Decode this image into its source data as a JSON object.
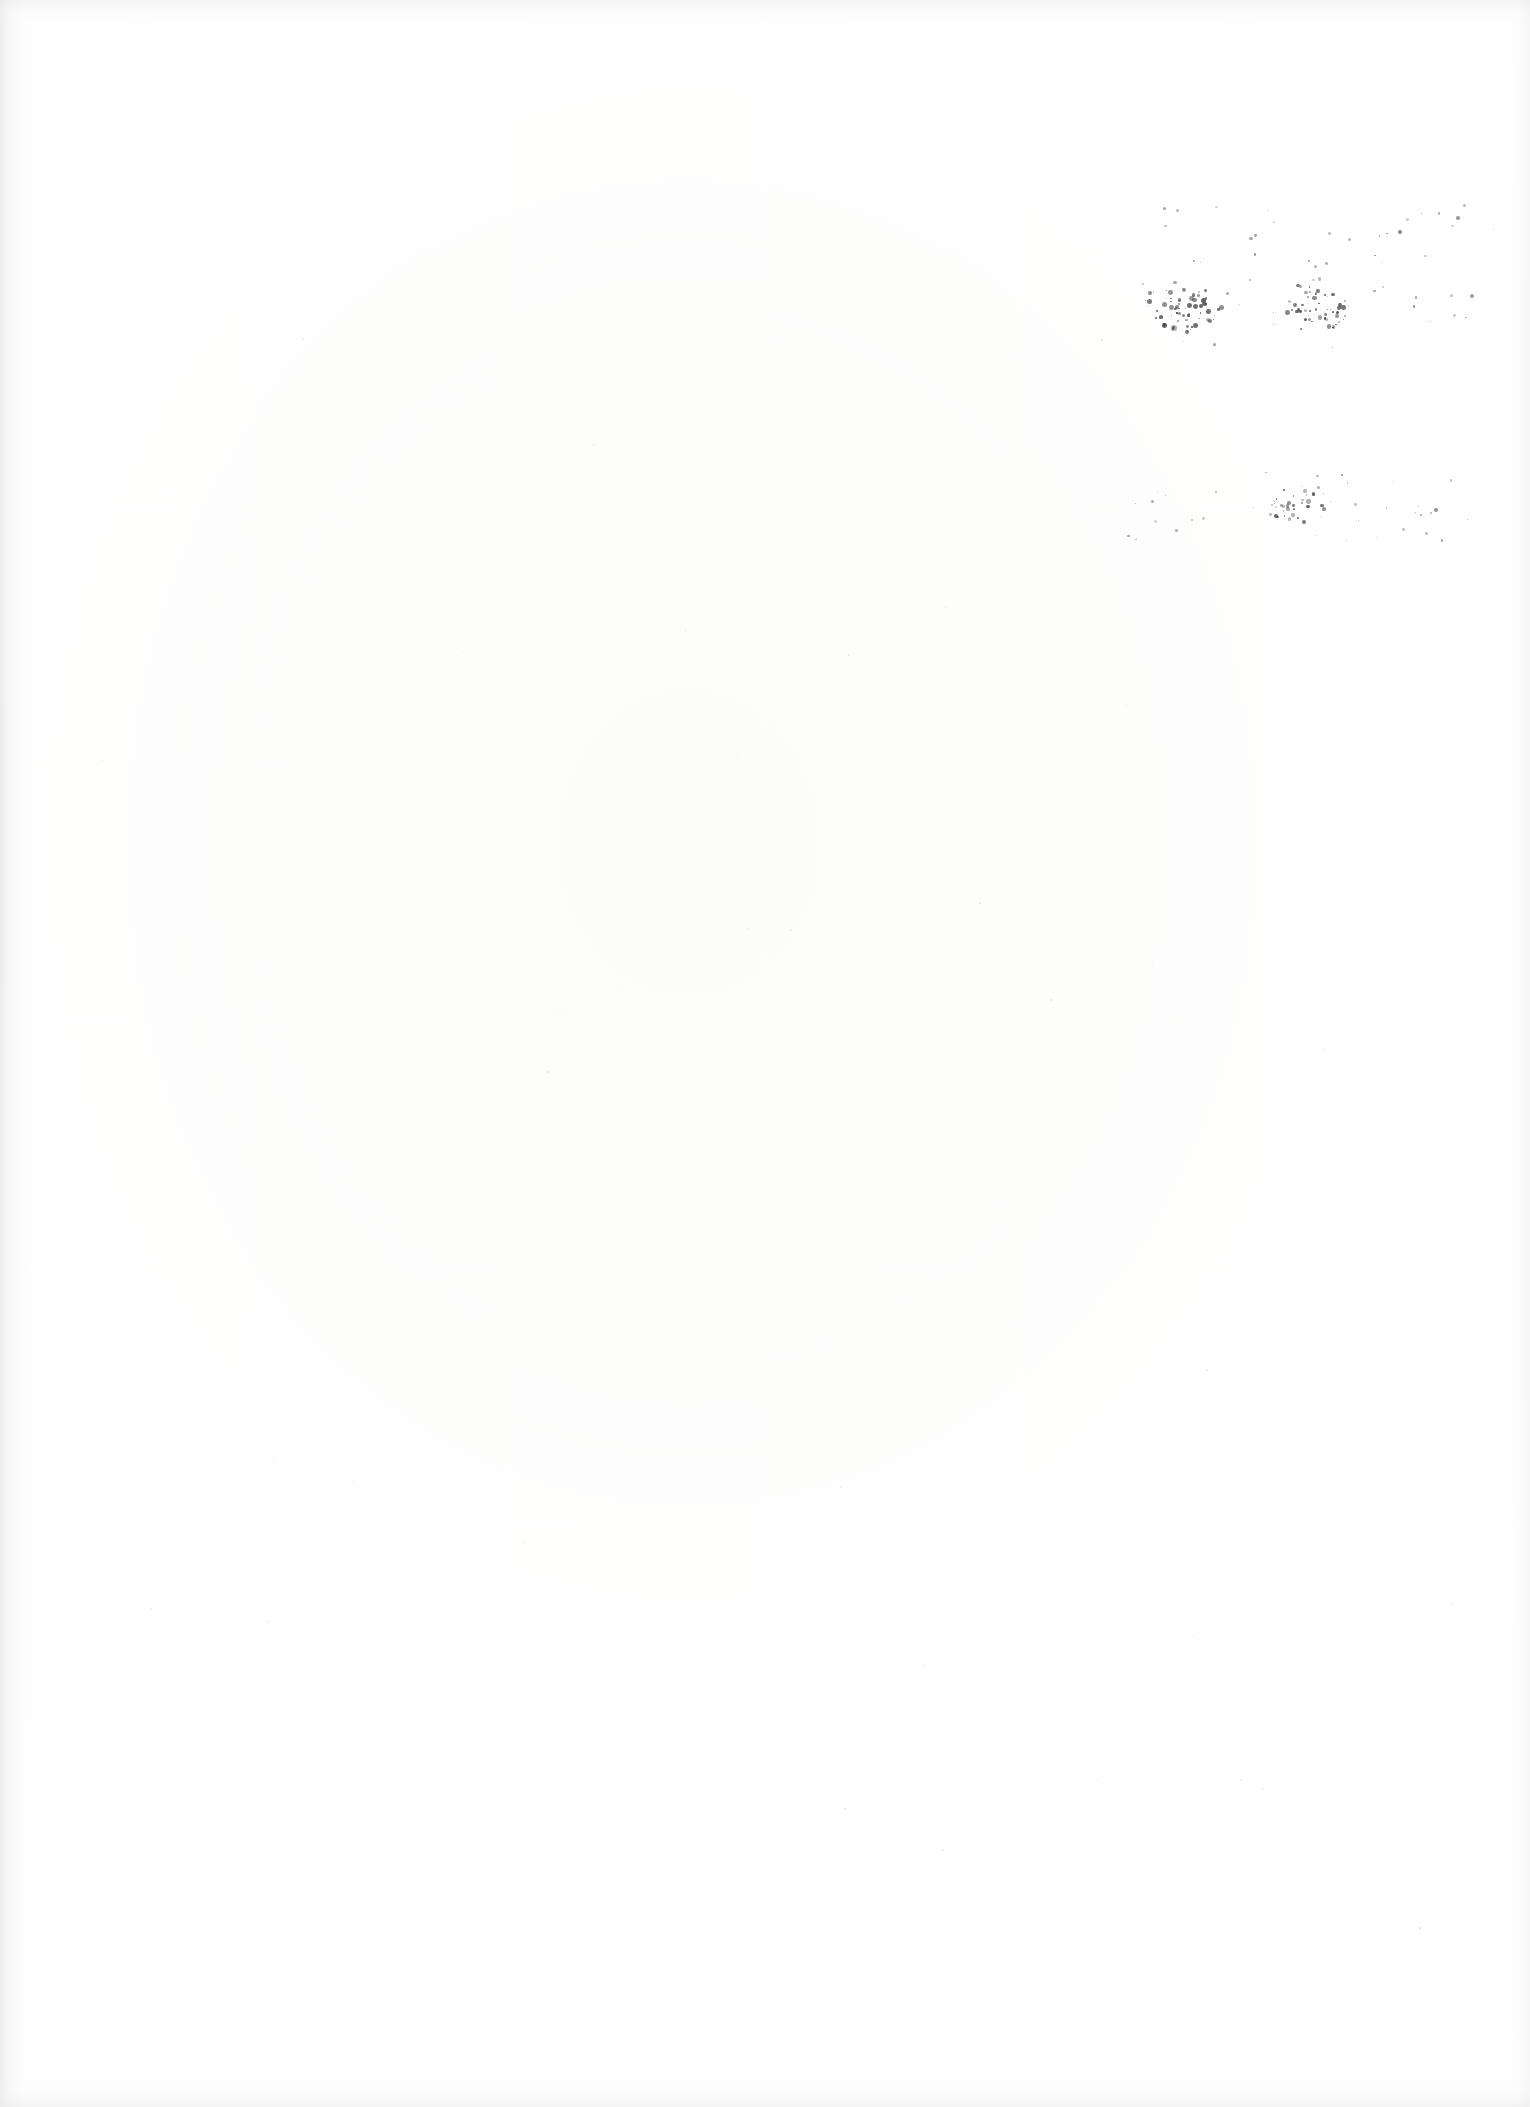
{
  "document": {
    "type": "scanned-page",
    "page_kind": "blank-leaf",
    "orientation": "portrait",
    "width_px": 1530,
    "height_px": 2107,
    "has_text": false,
    "has_figures": false,
    "has_page_number": false,
    "has_rules_or_borders": false,
    "visible_text": ""
  },
  "colors": {
    "page_background": "#fefefe",
    "paper_tone": "#fdfdfc",
    "speck_ink": "#3a3a3a",
    "edge_shadow": "#e4e4e4"
  },
  "edges": {
    "left_gutter_shadow": true,
    "top_shadow": true,
    "right_shadow": true,
    "bottom_shadow": true
  },
  "artifacts": {
    "description": "scanner speckle noise",
    "bands": [
      {
        "name": "upper-speckle-band",
        "x_range": [
          1140,
          1490
        ],
        "y_range": [
          270,
          340
        ],
        "density": "dense"
      },
      {
        "name": "lower-speckle-band",
        "x_range": [
          1150,
          1460
        ],
        "y_range": [
          480,
          530
        ],
        "density": "sparse"
      }
    ],
    "clusters": [
      {
        "name": "cluster-upper-left",
        "cx": 1185,
        "cy": 307,
        "rx": 42,
        "ry": 26,
        "count": 64,
        "max_r": 2.6,
        "opacity": 0.88
      },
      {
        "name": "cluster-upper-right",
        "cx": 1316,
        "cy": 305,
        "rx": 34,
        "ry": 27,
        "count": 52,
        "max_r": 2.4,
        "opacity": 0.86
      },
      {
        "name": "cluster-lower-mid",
        "cx": 1296,
        "cy": 506,
        "rx": 30,
        "ry": 18,
        "count": 30,
        "max_r": 2.2,
        "opacity": 0.8
      }
    ],
    "scatter": [
      {
        "name": "scatter-upper",
        "x_range": [
          1140,
          1495
        ],
        "y_range": [
          205,
          350
        ],
        "count": 54,
        "max_r": 1.7,
        "opacity": 0.55
      },
      {
        "name": "scatter-lower",
        "x_range": [
          1125,
          1470
        ],
        "y_range": [
          470,
          545
        ],
        "count": 40,
        "max_r": 1.5,
        "opacity": 0.48
      },
      {
        "name": "scatter-faint-page",
        "x_range": [
          60,
          1480
        ],
        "y_range": [
          60,
          2040
        ],
        "count": 46,
        "max_r": 1.1,
        "opacity": 0.13
      }
    ],
    "marks": [
      {
        "name": "mark-top-right-a",
        "x": 1400,
        "y": 232,
        "r": 2.2,
        "opacity": 0.6
      },
      {
        "name": "mark-top-right-b",
        "x": 1458,
        "y": 218,
        "r": 1.8,
        "opacity": 0.5
      },
      {
        "name": "mark-upper-far-right",
        "x": 1472,
        "y": 296,
        "r": 1.6,
        "opacity": 0.45
      },
      {
        "name": "mark-lower-right",
        "x": 1436,
        "y": 510,
        "r": 2.0,
        "opacity": 0.55
      },
      {
        "name": "mark-lower-left",
        "x": 1152,
        "y": 501,
        "r": 1.5,
        "opacity": 0.42
      }
    ]
  }
}
